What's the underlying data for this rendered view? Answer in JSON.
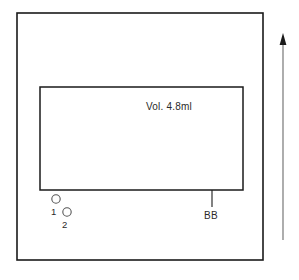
{
  "figure": {
    "background_color": "#ffffff",
    "line_color": "#1a1a1a",
    "labels": {
      "volume": "Vol. 4.8ml",
      "callout": "BB",
      "port_one": "1",
      "port_two": "2"
    },
    "panel": {
      "name": "outer-panel",
      "x": 17,
      "y": 13,
      "width": 246,
      "height": 247
    },
    "chamber": {
      "name": "inner-chamber",
      "x": 40,
      "y": 87,
      "width": 203,
      "height": 103
    },
    "callout_line": {
      "x": 212,
      "y_top": 190,
      "y_bottom": 207
    },
    "ports": [
      {
        "id": "1",
        "cx": 56,
        "cy": 199,
        "r": 4.2,
        "label_x": 52,
        "label_y": 214
      },
      {
        "id": "2",
        "cx": 67,
        "cy": 212,
        "r": 4.2,
        "label_x": 63,
        "label_y": 227
      }
    ],
    "direction_arrow": {
      "name": "up-arrow",
      "x": 283,
      "y_top": 36,
      "y_bottom": 240,
      "direction": "up"
    }
  }
}
